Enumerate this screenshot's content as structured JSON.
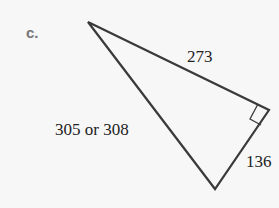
{
  "part_label": "c.",
  "triangle": {
    "sides": {
      "top": "273",
      "left": "305 or 308",
      "right": "136"
    },
    "right_angle_marker": true,
    "stroke_color": "#3a3a3a"
  }
}
